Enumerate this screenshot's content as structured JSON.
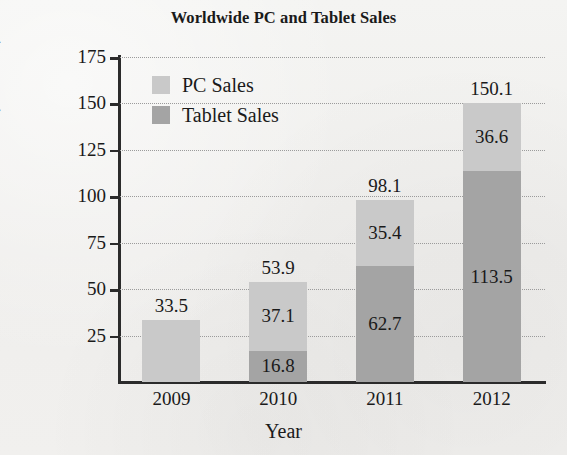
{
  "chart_data": {
    "type": "bar",
    "subtype": "stacked",
    "title": "Worldwide PC and Tablet Sales",
    "xlabel": "Year",
    "ylabel": "Number Sold (millions)",
    "categories": [
      "2009",
      "2010",
      "2011",
      "2012"
    ],
    "series": [
      {
        "name": "Tablet Sales",
        "color": "#a4a4a4",
        "values": [
          null,
          16.8,
          62.7,
          113.5
        ],
        "labels": [
          "",
          "16.8",
          "62.7",
          "113.5"
        ]
      },
      {
        "name": "PC Sales",
        "color": "#c9c9c9",
        "values": [
          33.5,
          37.1,
          35.4,
          36.6
        ],
        "labels": [
          "33.5",
          "37.1",
          "35.4",
          "36.6"
        ]
      }
    ],
    "totals": [
      33.5,
      53.9,
      98.1,
      150.1
    ],
    "total_labels": [
      "33.5",
      "53.9",
      "98.1",
      "150.1"
    ],
    "ylim": [
      0,
      175
    ],
    "yticks": [
      25,
      50,
      75,
      100,
      125,
      150,
      175
    ],
    "ytick_labels": [
      "25",
      "50",
      "75",
      "100",
      "125",
      "150",
      "175"
    ],
    "grid": true,
    "grid_style": "dotted",
    "legend_position": "upper-left-inside"
  },
  "legend": {
    "items": [
      {
        "label": "PC Sales",
        "color": "#c9c9c9"
      },
      {
        "label": "Tablet Sales",
        "color": "#a4a4a4"
      }
    ]
  }
}
